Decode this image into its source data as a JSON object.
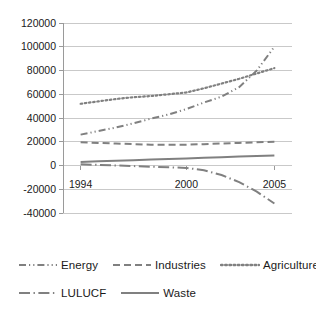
{
  "chart_data": {
    "type": "line",
    "title": "",
    "xlabel": "",
    "ylabel": "",
    "xlim": [
      1993,
      2006
    ],
    "ylim": [
      -40000,
      120000
    ],
    "grid": true,
    "legend_position": "bottom",
    "ytick_labels": [
      "120000",
      "100000",
      "80000",
      "60000",
      "40000",
      "20000",
      "0",
      "-20000",
      "-40000"
    ],
    "ytick_values": [
      120000,
      100000,
      80000,
      60000,
      40000,
      20000,
      0,
      -20000,
      -40000
    ],
    "xtick_labels": [
      "1994",
      "2000",
      "2005"
    ],
    "xtick_values": [
      1994,
      2000,
      2005
    ],
    "x": [
      1994,
      1995,
      1996,
      1997,
      1998,
      1999,
      2000,
      2001,
      2002,
      2003,
      2004,
      2005
    ],
    "series": [
      {
        "name": "Energy",
        "line_style": "dash-dot-dot",
        "color": "#808080",
        "values": [
          26000,
          29000,
          32000,
          35500,
          39500,
          43000,
          47500,
          53000,
          58000,
          66000,
          80000,
          100000
        ]
      },
      {
        "name": "Industries",
        "line_style": "dashed",
        "color": "#808080",
        "values": [
          19500,
          19000,
          18500,
          18000,
          17500,
          17500,
          17500,
          18000,
          18500,
          19000,
          19500,
          20000
        ]
      },
      {
        "name": "Agriculture",
        "line_style": "dotted",
        "color": "#808080",
        "values": [
          52000,
          54000,
          56000,
          57500,
          58500,
          60000,
          61500,
          65000,
          69000,
          73000,
          77500,
          82000
        ]
      },
      {
        "name": "LULUCF",
        "line_style": "long-dash-dot",
        "color": "#808080",
        "values": [
          1000,
          500,
          0,
          -500,
          -1000,
          -1500,
          -2000,
          -4000,
          -8000,
          -14000,
          -22000,
          -32000
        ]
      },
      {
        "name": "Waste",
        "line_style": "solid",
        "color": "#808080",
        "values": [
          3000,
          3500,
          4000,
          4500,
          5000,
          5500,
          6000,
          6500,
          7000,
          7500,
          8000,
          8500
        ]
      }
    ]
  },
  "legend": {
    "rows": [
      [
        {
          "label": "Energy",
          "style": "dash-dot-dot"
        },
        {
          "label": "Industries",
          "style": "dashed"
        },
        {
          "label": "Agriculture",
          "style": "dotted"
        }
      ],
      [
        {
          "label": "LULUCF",
          "style": "long-dash-dot"
        },
        {
          "label": "Waste",
          "style": "solid"
        }
      ]
    ]
  },
  "colors": {
    "series": "#808080",
    "gridline": "#c9c9c9",
    "axis": "#9a9a9a",
    "text": "#1a1a1a",
    "background": "#ffffff"
  }
}
